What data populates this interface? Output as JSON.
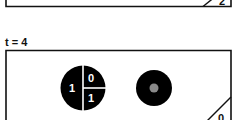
{
  "top_panel": {
    "corner_label": "2"
  },
  "bottom_panel": {
    "time_label": "t = 4",
    "corner_label": "0",
    "split_circle": {
      "left_value": "1",
      "top_right_value": "0",
      "bottom_right_value": "1"
    },
    "target_circle": {
      "outer_color": "#000000",
      "inner_color": "#8a8a8a"
    }
  }
}
